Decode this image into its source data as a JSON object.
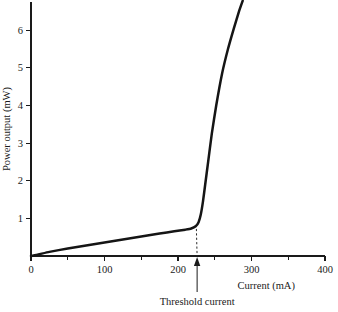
{
  "figure": {
    "background_color": "#ffffff",
    "ink_color": "#1a1a1a",
    "curve_color": "#151515"
  },
  "chart_data": {
    "type": "line",
    "title": "",
    "subtitle": "",
    "xlabel": "Current (mA)",
    "ylabel": "Power output (mW)",
    "xlim": [
      0,
      400
    ],
    "ylim": [
      0,
      6.75
    ],
    "grid": false,
    "legend": false,
    "legend_position": "none",
    "x_ticks_major": [
      0,
      100,
      200,
      300,
      400
    ],
    "x_tick_labels": [
      "0",
      "100",
      "200",
      "300",
      "400"
    ],
    "x_ticks_minor": [
      50,
      150,
      250,
      350
    ],
    "y_ticks_major": [
      1,
      2,
      3,
      4,
      5,
      6
    ],
    "y_tick_labels": [
      "1",
      "2",
      "3",
      "4",
      "5",
      "6"
    ],
    "y_ticks_minor": [],
    "series": [
      {
        "name": "Power output",
        "x": [
          0,
          10,
          25,
          50,
          75,
          100,
          125,
          150,
          175,
          195,
          210,
          218,
          224,
          228,
          231,
          234,
          237,
          241,
          246,
          252,
          260,
          268,
          276,
          283,
          288
        ],
        "values": [
          0.0,
          0.04,
          0.11,
          0.2,
          0.28,
          0.36,
          0.44,
          0.52,
          0.6,
          0.655,
          0.7,
          0.73,
          0.79,
          0.9,
          1.1,
          1.45,
          1.9,
          2.5,
          3.25,
          4.0,
          4.85,
          5.5,
          6.05,
          6.5,
          6.78
        ]
      }
    ],
    "annotations": [
      {
        "name": "threshold-current",
        "label": "Threshold current",
        "x": 226,
        "y": 0,
        "arrow": "up",
        "guide": "dashed",
        "guide_from_y": 0.72,
        "guide_to_y": 0.0
      }
    ],
    "notes": {
      "knee_x": 226,
      "knee_y": 0.72,
      "below_threshold_slope_mW_per_mA": 0.0031,
      "above_threshold_slope_mW_per_mA": 0.098
    }
  },
  "labels": {
    "x_axis_title": "Current (mA)",
    "y_axis_title": "Power output (mW)",
    "threshold_annotation": "Threshold current"
  }
}
